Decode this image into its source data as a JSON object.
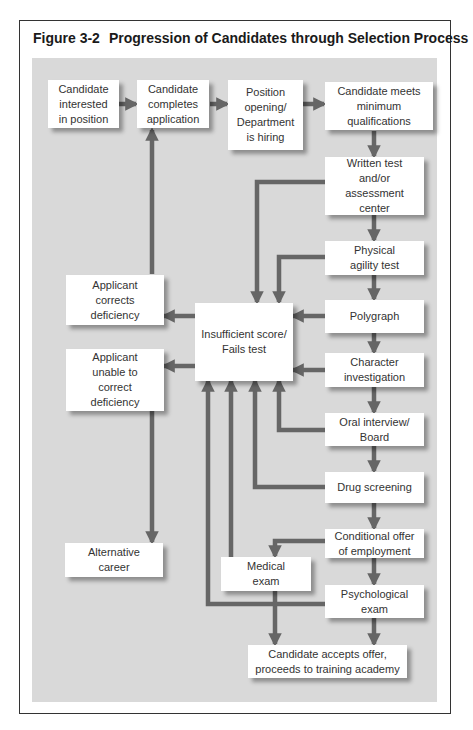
{
  "figure": {
    "number": "Figure 3-2",
    "title": "Progression of Candidates through Selection Process"
  },
  "colors": {
    "panel_background": "#d9d9d9",
    "box_fill": "#ffffff",
    "arrow": "#666666",
    "frame_border": "#333333"
  },
  "nodes": {
    "candidate_interested": "Candidate\ninterested\nin position",
    "candidate_completes": "Candidate\ncompletes\napplication",
    "position_opening": "Position\nopening/\nDepartment\nis hiring",
    "candidate_meets": "Candidate meets\nminimum\nqualifications",
    "written_test": "Written test\nand/or\nassessment\ncenter",
    "physical_agility": "Physical\nagility test",
    "polygraph": "Polygraph",
    "character_investigation": "Character\ninvestigation",
    "oral_interview": "Oral interview/\nBoard",
    "drug_screening": "Drug screening",
    "conditional_offer": "Conditional offer\nof employment",
    "medical_exam": "Medical\nexam",
    "psychological_exam": "Psychological\nexam",
    "candidate_accepts": "Candidate accepts offer,\nproceeds to training academy",
    "insufficient_score": "Insufficient score/\nFails test",
    "applicant_corrects": "Applicant\ncorrects\ndeficiency",
    "applicant_unable": "Applicant\nunable to\ncorrect\ndeficiency",
    "alternative_career": "Alternative\ncareer"
  },
  "edges": [
    {
      "from": "candidate_interested",
      "to": "candidate_completes"
    },
    {
      "from": "candidate_completes",
      "to": "position_opening"
    },
    {
      "from": "position_opening",
      "to": "candidate_meets"
    },
    {
      "from": "candidate_meets",
      "to": "written_test"
    },
    {
      "from": "written_test",
      "to": "physical_agility"
    },
    {
      "from": "physical_agility",
      "to": "polygraph"
    },
    {
      "from": "polygraph",
      "to": "character_investigation"
    },
    {
      "from": "character_investigation",
      "to": "oral_interview"
    },
    {
      "from": "oral_interview",
      "to": "drug_screening"
    },
    {
      "from": "drug_screening",
      "to": "conditional_offer"
    },
    {
      "from": "conditional_offer",
      "to": "psychological_exam"
    },
    {
      "from": "conditional_offer",
      "to": "medical_exam"
    },
    {
      "from": "medical_exam",
      "to": "candidate_accepts"
    },
    {
      "from": "psychological_exam",
      "to": "candidate_accepts"
    },
    {
      "from": "written_test",
      "to": "insufficient_score"
    },
    {
      "from": "physical_agility",
      "to": "insufficient_score"
    },
    {
      "from": "polygraph",
      "to": "insufficient_score"
    },
    {
      "from": "character_investigation",
      "to": "insufficient_score"
    },
    {
      "from": "oral_interview",
      "to": "insufficient_score"
    },
    {
      "from": "drug_screening",
      "to": "insufficient_score"
    },
    {
      "from": "medical_exam",
      "to": "insufficient_score"
    },
    {
      "from": "psychological_exam",
      "to": "insufficient_score"
    },
    {
      "from": "insufficient_score",
      "to": "applicant_corrects"
    },
    {
      "from": "insufficient_score",
      "to": "applicant_unable"
    },
    {
      "from": "applicant_corrects",
      "to": "candidate_completes"
    },
    {
      "from": "applicant_unable",
      "to": "alternative_career"
    }
  ]
}
